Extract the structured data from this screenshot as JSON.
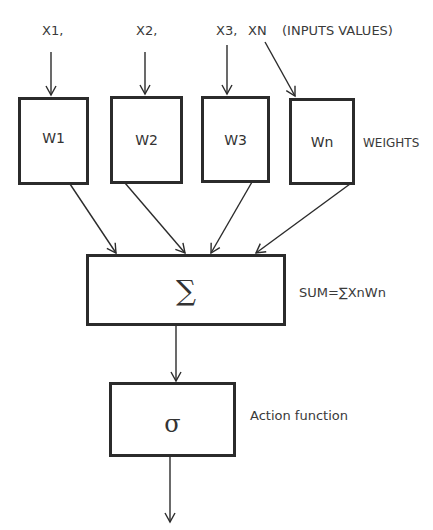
{
  "diagram": {
    "inputs": [
      {
        "label": "X1,"
      },
      {
        "label": "X2,"
      },
      {
        "label": "X3,"
      },
      {
        "label": "XN"
      }
    ],
    "inputs_caption": "(INPUTS VALUES)",
    "weights": [
      {
        "label": "W1"
      },
      {
        "label": "W2"
      },
      {
        "label": "W3"
      },
      {
        "label": "Wn"
      }
    ],
    "weights_caption": "WEIGHTS",
    "sum_node": {
      "symbol": "∑",
      "caption": "SUM=∑XnWn"
    },
    "activation_node": {
      "symbol": "σ",
      "caption": "Action function"
    },
    "colors": {
      "stroke": "#2b2b2b",
      "text": "#3a3a3a",
      "background": "#ffffff"
    }
  }
}
